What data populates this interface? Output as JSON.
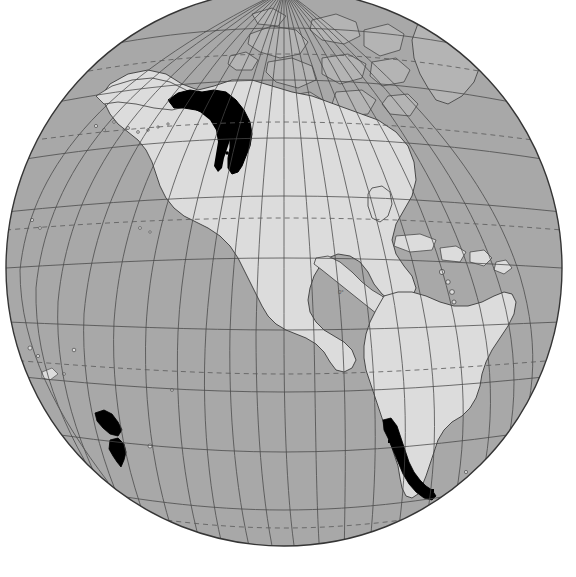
{
  "figure": {
    "name": "world-globe-distribution-map",
    "type": "orthographic-globe-map",
    "title": "Global distribution map on an orthographic globe centred on the Pacific and the Americas",
    "caption": "",
    "background_color": "#ffffff",
    "canvas": {
      "width": 576,
      "height": 577
    }
  },
  "projection": {
    "type": "orthographic",
    "center_lon": -100,
    "center_lat": 18,
    "globe_cx": 284,
    "globe_cy": 268,
    "globe_r": 278,
    "clipped_top": true,
    "clipped_top_y": 0
  },
  "palette": {
    "ocean": "#a9a9a9",
    "land": "#dcdcdc",
    "land_dark": "#b4b4b4",
    "ice_sheet": "#e6e6e6",
    "highlight": "#000000",
    "graticule": "#4a4a4a",
    "graticule_dashed": "#5a5a5a",
    "coastline": "#3c3c3c",
    "border": "#6e6e6e",
    "limb": "#353535",
    "page": "#ffffff"
  },
  "graticule": {
    "meridian_spacing_deg": 15,
    "parallel_spacing_deg": 10,
    "line_style": "solid",
    "dashed_parallels": [
      {
        "label": "Arctic Circle",
        "lat": 66.5
      },
      {
        "label": "Tropic of Cancer",
        "lat": 23.5
      },
      {
        "label": "Tropic of Capricorn",
        "lat": -23.5
      },
      {
        "label": "Antarctic Circle",
        "lat": -66.5
      }
    ],
    "equator_label": "0°",
    "equator_lat": 0
  },
  "highlight_regions": [
    {
      "id": "pacific-northwest",
      "label": "Pacific Northwest coast (Alaska Panhandle, British Columbia, Washington)",
      "color": "#000000",
      "approx_lat_range": [
        44,
        61
      ],
      "approx_lon_range": [
        -140,
        -122
      ]
    },
    {
      "id": "southern-chile",
      "label": "Southern Chile (Valdivian temperate coast to Tierra del Fuego)",
      "color": "#000000",
      "approx_lat_range": [
        -56,
        -37
      ],
      "approx_lon_range": [
        -76,
        -70
      ]
    },
    {
      "id": "new-zealand",
      "label": "New Zealand (North Island and South Island)",
      "color": "#000000",
      "approx_lat_range": [
        -47,
        -34
      ],
      "approx_lon_range": [
        166,
        179
      ]
    }
  ],
  "landmasses": [
    {
      "id": "north-america",
      "label": "North America",
      "shade": "land"
    },
    {
      "id": "south-america",
      "label": "South America",
      "shade": "land"
    },
    {
      "id": "greenland",
      "label": "Greenland",
      "shade": "land_dark"
    },
    {
      "id": "canadian-arctic-archipelago",
      "label": "Canadian Arctic Archipelago",
      "shade": "land_dark"
    },
    {
      "id": "central-america",
      "label": "Central America",
      "shade": "land"
    },
    {
      "id": "caribbean-islands",
      "label": "Caribbean islands",
      "shade": "land"
    },
    {
      "id": "antarctica",
      "label": "Antarctica",
      "shade": "ice_sheet"
    },
    {
      "id": "pacific-islands",
      "label": "Pacific islands",
      "shade": "land"
    }
  ],
  "legend": {
    "visible": false,
    "items": []
  },
  "scale_bar": {
    "visible": false
  },
  "north_arrow": {
    "visible": false
  }
}
